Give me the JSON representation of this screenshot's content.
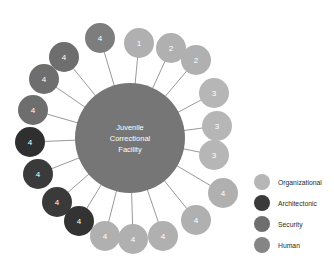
{
  "chart_data": {
    "type": "diagram",
    "diagram_type": "radial-hub-and-spoke",
    "title": "",
    "hub": {
      "label_lines": [
        "Juvenile",
        "Correctional",
        "Facility"
      ],
      "color": "#767676",
      "radius": 55
    },
    "legend": {
      "position": "right",
      "entries": [
        {
          "label": "Organizational",
          "color": "#b6b6b6"
        },
        {
          "label": "Architectonic",
          "color": "#3a3a3a"
        },
        {
          "label": "Security",
          "color": "#6e6e6e"
        },
        {
          "label": "Human",
          "color": "#858585"
        }
      ]
    },
    "nodes": [
      {
        "label": "4",
        "category": "Human",
        "color": "#7d7d7d",
        "angle_deg": -100,
        "cx": 100,
        "cy": 38,
        "r": 15
      },
      {
        "label": "1",
        "category": "Organizational",
        "color": "#b0b0b0",
        "angle_deg": -80,
        "cx": 139,
        "cy": 43,
        "r": 15
      },
      {
        "label": "2",
        "category": "Organizational",
        "color": "#b0b0b0",
        "angle_deg": -62,
        "cx": 171,
        "cy": 48,
        "r": 15
      },
      {
        "label": "2",
        "category": "Organizational",
        "color": "#b0b0b0",
        "angle_deg": -48,
        "cx": 196,
        "cy": 60,
        "r": 15
      },
      {
        "label": "3",
        "category": "Organizational",
        "color": "#b6b6b6",
        "angle_deg": -32,
        "cx": 214,
        "cy": 93,
        "r": 15
      },
      {
        "label": "3",
        "category": "Organizational",
        "color": "#b6b6b6",
        "angle_deg": -12,
        "cx": 217,
        "cy": 126,
        "r": 15
      },
      {
        "label": "3",
        "category": "Organizational",
        "color": "#b6b6b6",
        "angle_deg": 8,
        "cx": 214,
        "cy": 155,
        "r": 15
      },
      {
        "label": "4",
        "category": "Organizational",
        "color": "#b0b0b0",
        "angle_deg": 30,
        "cx": 223,
        "cy": 193,
        "r": 15
      },
      {
        "label": "4",
        "category": "Organizational",
        "color": "#b0b0b0",
        "angle_deg": 48,
        "cx": 196,
        "cy": 220,
        "r": 15
      },
      {
        "label": "4",
        "category": "Organizational",
        "color": "#b0b0b0",
        "angle_deg": 64,
        "cx": 163,
        "cy": 236,
        "r": 15
      },
      {
        "label": "4",
        "category": "Organizational",
        "color": "#b0b0b0",
        "angle_deg": 84,
        "cx": 133,
        "cy": 239,
        "r": 15
      },
      {
        "label": "4",
        "category": "Organizational",
        "color": "#b0b0b0",
        "angle_deg": 100,
        "cx": 105,
        "cy": 236,
        "r": 15
      },
      {
        "label": "4",
        "category": "Architectonic",
        "color": "#333333",
        "angle_deg": 116,
        "cx": 79,
        "cy": 221,
        "r": 15
      },
      {
        "label": "4",
        "category": "Architectonic",
        "color": "#3a3a3a",
        "angle_deg": 132,
        "cx": 57,
        "cy": 202,
        "r": 15
      },
      {
        "label": "4",
        "category": "Architectonic",
        "color": "#3a3a3a",
        "angle_deg": 150,
        "cx": 38,
        "cy": 174,
        "r": 15
      },
      {
        "label": "4",
        "category": "Architectonic",
        "color": "#2f2f2f",
        "angle_deg": 170,
        "cx": 30,
        "cy": 142,
        "r": 15
      },
      {
        "label": "4",
        "category": "Security",
        "color": "#6e6e6e",
        "angle_deg": -170,
        "cx": 33,
        "cy": 110,
        "r": 15
      },
      {
        "label": "4",
        "category": "Security",
        "color": "#6e6e6e",
        "angle_deg": -152,
        "cx": 44,
        "cy": 79,
        "r": 15
      },
      {
        "label": "4",
        "category": "Security",
        "color": "#6e6e6e",
        "angle_deg": -134,
        "cx": 64,
        "cy": 57,
        "r": 15
      }
    ]
  }
}
